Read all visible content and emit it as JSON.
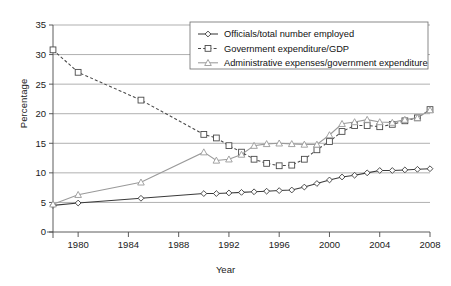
{
  "chart_data": {
    "type": "line",
    "title": "",
    "xlabel": "Year",
    "ylabel": "Percentage",
    "xlim": [
      1978,
      2008
    ],
    "ylim": [
      0,
      35
    ],
    "yticks": [
      0,
      5,
      10,
      15,
      20,
      25,
      30,
      35
    ],
    "xticks": [
      1980,
      1984,
      1988,
      1992,
      1996,
      2000,
      2004,
      2008
    ],
    "grid": true,
    "legend_position": "top-right",
    "series": [
      {
        "name": "Officials/total number employed",
        "marker": "diamond",
        "linestyle": "solid",
        "color": "#3a3a3a",
        "points": [
          [
            1978,
            4.5
          ],
          [
            1980,
            4.9
          ],
          [
            1985,
            5.7
          ],
          [
            1990,
            6.5
          ],
          [
            1991,
            6.5
          ],
          [
            1992,
            6.6
          ],
          [
            1993,
            6.7
          ],
          [
            1994,
            6.8
          ],
          [
            1995,
            6.9
          ],
          [
            1996,
            7.0
          ],
          [
            1997,
            7.1
          ],
          [
            1998,
            7.6
          ],
          [
            1999,
            8.2
          ],
          [
            2000,
            8.8
          ],
          [
            2001,
            9.3
          ],
          [
            2002,
            9.6
          ],
          [
            2003,
            10.0
          ],
          [
            2004,
            10.4
          ],
          [
            2005,
            10.4
          ],
          [
            2006,
            10.5
          ],
          [
            2007,
            10.6
          ],
          [
            2008,
            10.7
          ]
        ]
      },
      {
        "name": "Government expenditure/GDP",
        "marker": "square",
        "linestyle": "dashed",
        "color": "#4a4a4a",
        "points": [
          [
            1978,
            30.8
          ],
          [
            1980,
            27.0
          ],
          [
            1985,
            22.3
          ],
          [
            1990,
            16.5
          ],
          [
            1991,
            15.9
          ],
          [
            1992,
            14.6
          ],
          [
            1993,
            13.5
          ],
          [
            1994,
            12.3
          ],
          [
            1995,
            11.6
          ],
          [
            1996,
            11.2
          ],
          [
            1997,
            11.3
          ],
          [
            1998,
            12.3
          ],
          [
            1999,
            13.9
          ],
          [
            2000,
            15.3
          ],
          [
            2001,
            17.0
          ],
          [
            2002,
            18.0
          ],
          [
            2003,
            18.0
          ],
          [
            2004,
            17.8
          ],
          [
            2005,
            18.2
          ],
          [
            2006,
            18.8
          ],
          [
            2007,
            19.3
          ],
          [
            2008,
            20.7
          ]
        ]
      },
      {
        "name": "Administrative expenses/government expenditure",
        "marker": "triangle",
        "linestyle": "solid",
        "color": "#9a9a9a",
        "points": [
          [
            1978,
            4.7
          ],
          [
            1980,
            6.3
          ],
          [
            1985,
            8.4
          ],
          [
            1990,
            13.5
          ],
          [
            1991,
            12.1
          ],
          [
            1992,
            12.3
          ],
          [
            1993,
            13.1
          ],
          [
            1994,
            14.6
          ],
          [
            1995,
            14.9
          ],
          [
            1996,
            15.0
          ],
          [
            1997,
            14.9
          ],
          [
            1998,
            14.8
          ],
          [
            1999,
            14.8
          ],
          [
            2000,
            16.4
          ],
          [
            2001,
            18.3
          ],
          [
            2002,
            18.6
          ],
          [
            2003,
            19.0
          ],
          [
            2004,
            18.6
          ],
          [
            2005,
            18.5
          ],
          [
            2006,
            19.0
          ],
          [
            2007,
            19.3
          ],
          [
            2008,
            20.6
          ]
        ]
      }
    ]
  },
  "legend": {
    "items": [
      "Officials/total number employed",
      "Government expenditure/GDP",
      "Administrative expenses/government expenditure"
    ]
  }
}
